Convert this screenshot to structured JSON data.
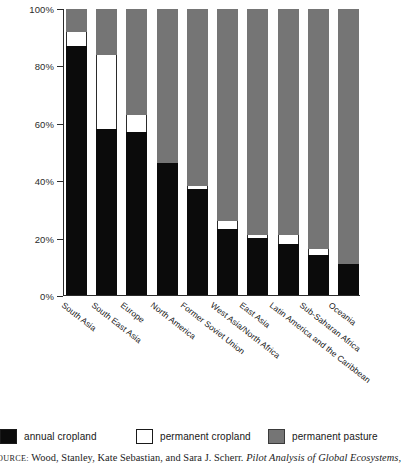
{
  "chart_data": {
    "type": "bar",
    "subtype": "stacked-100-percent",
    "title": "",
    "xlabel": "",
    "ylabel": "",
    "ylim": [
      0,
      100
    ],
    "yticks": [
      0,
      20,
      40,
      60,
      80,
      100
    ],
    "ytick_labels": [
      "0%",
      "20%",
      "40%",
      "60%",
      "80%",
      "100%"
    ],
    "grid": false,
    "legend_position": "bottom",
    "categories": [
      "South Asia",
      "South East Asia",
      "Europe",
      "North America",
      "Former Soviet Union",
      "West Asia/North Africa",
      "East Asia",
      "Latin America and the Caribbean",
      "Sub-Saharan Africa",
      "Oceania"
    ],
    "series": [
      {
        "name": "annual cropland",
        "color": "#0b0b0b",
        "values": [
          87,
          58,
          57,
          46,
          37,
          23,
          20,
          18,
          14,
          11
        ]
      },
      {
        "name": "permanent cropland",
        "color": "#ffffff",
        "values": [
          5,
          26,
          6,
          0,
          1,
          3,
          1,
          3,
          2,
          0
        ]
      },
      {
        "name": "permanent pasture",
        "color": "#757575",
        "values": [
          8,
          16,
          37,
          54,
          62,
          74,
          79,
          79,
          84,
          89
        ]
      }
    ]
  },
  "yaxis": {
    "ticks": [
      {
        "label": "100%",
        "value": 100
      },
      {
        "label": "80%",
        "value": 80
      },
      {
        "label": "60%",
        "value": 60
      },
      {
        "label": "40%",
        "value": 40
      },
      {
        "label": "20%",
        "value": 20
      },
      {
        "label": "0%",
        "value": 0
      }
    ]
  },
  "legend": {
    "items": [
      {
        "label": "annual cropland",
        "color": "#0b0b0b"
      },
      {
        "label": "permanent cropland",
        "color": "#ffffff"
      },
      {
        "label": "permanent pasture",
        "color": "#757575"
      }
    ]
  },
  "source": {
    "prefix": "OURCE:",
    "authors": "Wood, Stanley, Kate Sebastian, and Sara J. Scherr.",
    "title_italic": "Pilot Analysis of Global Ecosystems,"
  }
}
